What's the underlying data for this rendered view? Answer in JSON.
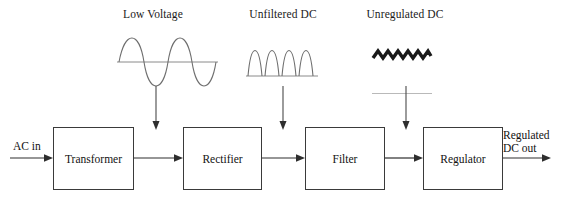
{
  "diagram": {
    "background_color": "#ffffff",
    "line_color": "#3a3a3a",
    "waveform_color": "#6e6e6e",
    "ripple_color": "#1a1a1a",
    "flatline_color": "#b9b9b9"
  },
  "waveform_labels": [
    {
      "text": "Low Voltage",
      "icon": "sine-wave-icon"
    },
    {
      "text": "Unfiltered DC",
      "icon": "rectified-sine-wave-icon"
    },
    {
      "text": "Unregulated DC",
      "icon": "ripple-sawtooth-icon"
    }
  ],
  "stages": [
    {
      "label": "Transformer"
    },
    {
      "label": "Rectifier"
    },
    {
      "label": "Filter"
    },
    {
      "label": "Regulator"
    }
  ],
  "io": {
    "input_label": "AC in",
    "output_label_line1": "Regulated",
    "output_label_line2": "DC out"
  }
}
